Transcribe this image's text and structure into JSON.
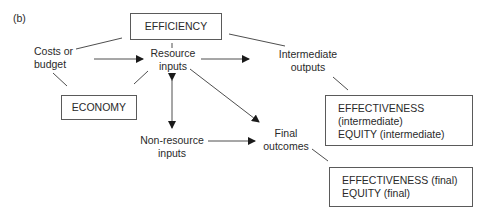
{
  "figure_label": "(b)",
  "boxes": {
    "efficiency": "EFFICIENCY",
    "economy": "ECONOMY",
    "intermediate": {
      "line1": "EFFECTIVENESS",
      "line2": "(intermediate)",
      "line3": "EQUITY (intermediate)"
    },
    "final": {
      "line1": "EFFECTIVENESS (final)",
      "line2": "EQUITY (final)"
    }
  },
  "nodes": {
    "costs": {
      "line1": "Costs or",
      "line2": "budget"
    },
    "resource_inputs": {
      "line1": "Resource",
      "line2": "inputs"
    },
    "intermediate_outputs": {
      "line1": "Intermediate",
      "line2": "outputs"
    },
    "non_resource_inputs": {
      "line1": "Non-resource",
      "line2": "inputs"
    },
    "final_outcomes": {
      "line1": "Final",
      "line2": "outcomes"
    }
  },
  "colors": {
    "line": "#2a2a2a",
    "box_border": "#5a5a5a",
    "text": "#2a2a2a"
  }
}
